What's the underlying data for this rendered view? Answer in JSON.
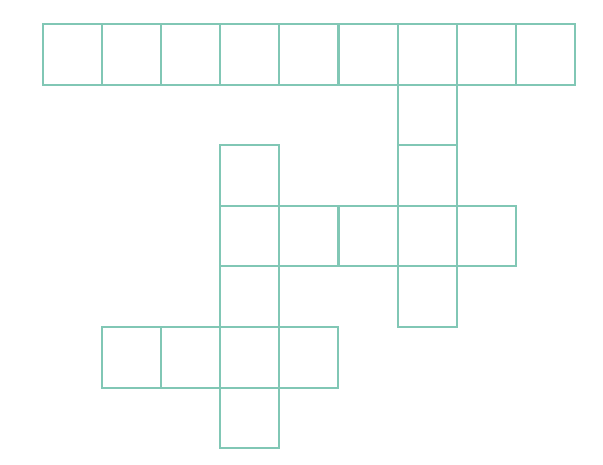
{
  "page": {
    "background_color": "#ffffff",
    "width": 603,
    "height": 465
  },
  "grid": {
    "name": "crossword-grid",
    "line_color": "#81c7b5",
    "cell_fill_color": "#ffffff",
    "line_width": 2,
    "origin_x": 42,
    "origin_y": 23,
    "cell_width": 59.1,
    "cell_height": 60.6,
    "columns": 9,
    "rows": 7,
    "filled_cells": [
      {
        "row": 0,
        "col": 0,
        "letter": ""
      },
      {
        "row": 0,
        "col": 1,
        "letter": ""
      },
      {
        "row": 0,
        "col": 2,
        "letter": ""
      },
      {
        "row": 0,
        "col": 3,
        "letter": ""
      },
      {
        "row": 0,
        "col": 4,
        "letter": ""
      },
      {
        "row": 0,
        "col": 5,
        "letter": ""
      },
      {
        "row": 0,
        "col": 6,
        "letter": ""
      },
      {
        "row": 0,
        "col": 7,
        "letter": ""
      },
      {
        "row": 0,
        "col": 8,
        "letter": ""
      },
      {
        "row": 1,
        "col": 6,
        "letter": ""
      },
      {
        "row": 2,
        "col": 3,
        "letter": ""
      },
      {
        "row": 2,
        "col": 6,
        "letter": ""
      },
      {
        "row": 3,
        "col": 3,
        "letter": ""
      },
      {
        "row": 3,
        "col": 4,
        "letter": ""
      },
      {
        "row": 3,
        "col": 5,
        "letter": ""
      },
      {
        "row": 3,
        "col": 6,
        "letter": ""
      },
      {
        "row": 3,
        "col": 7,
        "letter": ""
      },
      {
        "row": 4,
        "col": 3,
        "letter": ""
      },
      {
        "row": 4,
        "col": 6,
        "letter": ""
      },
      {
        "row": 5,
        "col": 1,
        "letter": ""
      },
      {
        "row": 5,
        "col": 2,
        "letter": ""
      },
      {
        "row": 5,
        "col": 3,
        "letter": ""
      },
      {
        "row": 5,
        "col": 4,
        "letter": ""
      },
      {
        "row": 6,
        "col": 3,
        "letter": ""
      }
    ],
    "entries": [
      {
        "name": "across-row-0",
        "direction": "across",
        "row": 0,
        "start_col": 0,
        "length": 9
      },
      {
        "name": "across-row-3",
        "direction": "across",
        "row": 3,
        "start_col": 3,
        "length": 5
      },
      {
        "name": "across-row-5",
        "direction": "across",
        "row": 5,
        "start_col": 1,
        "length": 4
      },
      {
        "name": "down-col-6",
        "direction": "down",
        "col": 6,
        "start_row": 0,
        "length": 5
      },
      {
        "name": "down-col-3",
        "direction": "down",
        "col": 3,
        "start_row": 2,
        "length": 5
      }
    ]
  }
}
